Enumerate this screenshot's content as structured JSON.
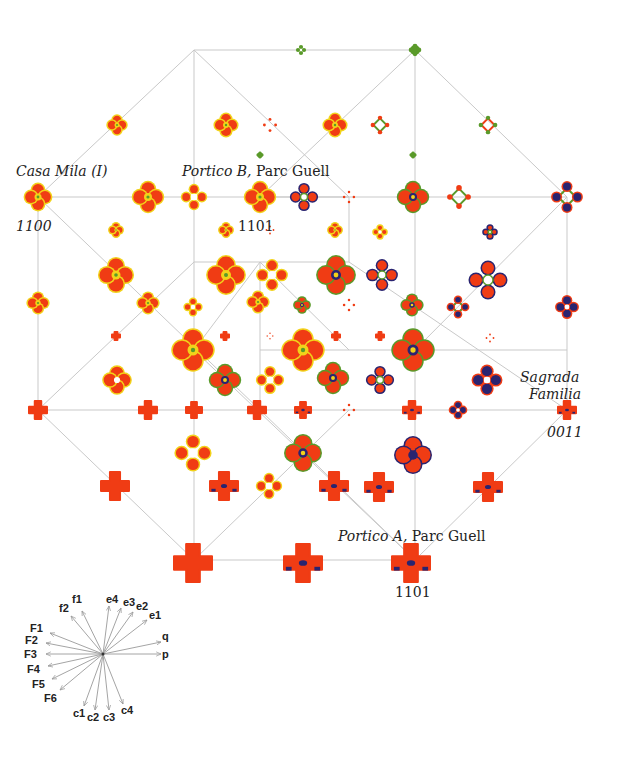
{
  "figure": {
    "type": "hypercube-projection-diagram",
    "colors": {
      "edge": "#c9c9c9",
      "red": "#f03c14",
      "yellow": "#f2d21a",
      "green": "#5a9a2a",
      "navy": "#2a2470",
      "arrow": "#9a9a9a"
    }
  },
  "labels": {
    "casa_mila": "Casa Mila (I)",
    "casa_mila_code": "1100",
    "portico_b_italic": "Portico B,",
    "portico_b_rest": " Parc Guell",
    "portico_b_code": "1101",
    "sagrada_1": "Sagrada",
    "sagrada_2": "Familia",
    "sagrada_code": "0011",
    "portico_a_italic": "Portico A,",
    "portico_a_rest": " Parc Guell",
    "portico_a_code": "1101"
  },
  "edges": [
    [
      194,
      50,
      415,
      50
    ],
    [
      194,
      50,
      38,
      197
    ],
    [
      194,
      50,
      194,
      197
    ],
    [
      194,
      50,
      349,
      197
    ],
    [
      415,
      50,
      415,
      197
    ],
    [
      415,
      50,
      567,
      197
    ],
    [
      415,
      50,
      260,
      197
    ],
    [
      38,
      197,
      349,
      197
    ],
    [
      260,
      197,
      567,
      197
    ],
    [
      38,
      197,
      38,
      410
    ],
    [
      38,
      197,
      260,
      410
    ],
    [
      194,
      197,
      194,
      350
    ],
    [
      349,
      197,
      349,
      262
    ],
    [
      349,
      262,
      194,
      262
    ],
    [
      349,
      262,
      567,
      410
    ],
    [
      415,
      197,
      415,
      410
    ],
    [
      567,
      197,
      567,
      410
    ],
    [
      567,
      197,
      415,
      350
    ],
    [
      194,
      262,
      38,
      410
    ],
    [
      260,
      262,
      260,
      410
    ],
    [
      260,
      350,
      567,
      350
    ],
    [
      38,
      410,
      567,
      410
    ],
    [
      38,
      410,
      194,
      560
    ],
    [
      194,
      350,
      194,
      560
    ],
    [
      194,
      350,
      415,
      560
    ],
    [
      260,
      410,
      415,
      560
    ],
    [
      349,
      410,
      194,
      560
    ],
    [
      415,
      410,
      415,
      560
    ],
    [
      567,
      410,
      415,
      560
    ],
    [
      194,
      560,
      415,
      560
    ],
    [
      260,
      262,
      349,
      350
    ],
    [
      260,
      262,
      194,
      350
    ]
  ],
  "nodes": [
    {
      "x": 301,
      "y": 50,
      "s": 6,
      "kind": "green-ring"
    },
    {
      "x": 415,
      "y": 50,
      "s": 7,
      "kind": "green-solid"
    },
    {
      "x": 117,
      "y": 125,
      "s": 10,
      "kind": "yellow-cluster"
    },
    {
      "x": 226,
      "y": 125,
      "s": 12,
      "kind": "yellow-cluster"
    },
    {
      "x": 270,
      "y": 125,
      "s": 8,
      "kind": "red-dots"
    },
    {
      "x": 335,
      "y": 125,
      "s": 12,
      "kind": "yellow-cluster"
    },
    {
      "x": 380,
      "y": 125,
      "s": 11,
      "kind": "red-lattice"
    },
    {
      "x": 488,
      "y": 125,
      "s": 11,
      "kind": "green-lattice"
    },
    {
      "x": 260,
      "y": 155,
      "s": 4,
      "kind": "green-solid"
    },
    {
      "x": 413,
      "y": 155,
      "s": 4,
      "kind": "green-solid"
    },
    {
      "x": 38,
      "y": 197,
      "s": 14,
      "kind": "yellow-cluster"
    },
    {
      "x": 148,
      "y": 197,
      "s": 16,
      "kind": "yellow-cluster"
    },
    {
      "x": 194,
      "y": 197,
      "s": 13,
      "kind": "red-ring"
    },
    {
      "x": 260,
      "y": 197,
      "s": 16,
      "kind": "yellow-cluster"
    },
    {
      "x": 304,
      "y": 197,
      "s": 14,
      "kind": "mixed-ring"
    },
    {
      "x": 349,
      "y": 197,
      "s": 7,
      "kind": "red-dots"
    },
    {
      "x": 413,
      "y": 197,
      "s": 16,
      "kind": "mixed-cluster"
    },
    {
      "x": 459,
      "y": 197,
      "s": 14,
      "kind": "red-lattice"
    },
    {
      "x": 567,
      "y": 197,
      "s": 16,
      "kind": "navy-lattice"
    },
    {
      "x": 116,
      "y": 230,
      "s": 7,
      "kind": "yellow-cluster"
    },
    {
      "x": 226,
      "y": 230,
      "s": 7,
      "kind": "yellow-cluster"
    },
    {
      "x": 270,
      "y": 230,
      "s": 5,
      "kind": "red-dots"
    },
    {
      "x": 335,
      "y": 230,
      "s": 7,
      "kind": "yellow-cluster"
    },
    {
      "x": 380,
      "y": 232,
      "s": 7,
      "kind": "red-ring"
    },
    {
      "x": 490,
      "y": 232,
      "s": 7,
      "kind": "mixed-ring"
    },
    {
      "x": 116,
      "y": 275,
      "s": 18,
      "kind": "yellow-cluster"
    },
    {
      "x": 226,
      "y": 275,
      "s": 20,
      "kind": "yellow-cluster"
    },
    {
      "x": 272,
      "y": 275,
      "s": 16,
      "kind": "red-ring"
    },
    {
      "x": 336,
      "y": 275,
      "s": 20,
      "kind": "mixed-cluster"
    },
    {
      "x": 382,
      "y": 275,
      "s": 16,
      "kind": "mixed-ring"
    },
    {
      "x": 488,
      "y": 280,
      "s": 20,
      "kind": "mixed-ring"
    },
    {
      "x": 38,
      "y": 303,
      "s": 11,
      "kind": "yellow-cluster"
    },
    {
      "x": 148,
      "y": 303,
      "s": 11,
      "kind": "yellow-cluster"
    },
    {
      "x": 193,
      "y": 307,
      "s": 9,
      "kind": "red-ring"
    },
    {
      "x": 258,
      "y": 302,
      "s": 11,
      "kind": "yellow-cluster"
    },
    {
      "x": 302,
      "y": 305,
      "s": 8,
      "kind": "mixed-cluster"
    },
    {
      "x": 349,
      "y": 305,
      "s": 7,
      "kind": "red-dots"
    },
    {
      "x": 412,
      "y": 305,
      "s": 11,
      "kind": "mixed-cluster"
    },
    {
      "x": 458,
      "y": 307,
      "s": 11,
      "kind": "navy-lattice"
    },
    {
      "x": 567,
      "y": 307,
      "s": 12,
      "kind": "navy-ring"
    },
    {
      "x": 116,
      "y": 336,
      "s": 4,
      "kind": "red-solid"
    },
    {
      "x": 225,
      "y": 336,
      "s": 4,
      "kind": "red-solid"
    },
    {
      "x": 270,
      "y": 336,
      "s": 4,
      "kind": "red-dots"
    },
    {
      "x": 336,
      "y": 336,
      "s": 4,
      "kind": "red-solid"
    },
    {
      "x": 380,
      "y": 336,
      "s": 4,
      "kind": "red-solid"
    },
    {
      "x": 490,
      "y": 338,
      "s": 5,
      "kind": "red-dots"
    },
    {
      "x": 193,
      "y": 350,
      "s": 22,
      "kind": "yellow-cluster"
    },
    {
      "x": 303,
      "y": 350,
      "s": 22,
      "kind": "yellow-cluster"
    },
    {
      "x": 413,
      "y": 350,
      "s": 22,
      "kind": "mixed-cluster"
    },
    {
      "x": 117,
      "y": 380,
      "s": 14,
      "kind": "red-cluster"
    },
    {
      "x": 225,
      "y": 380,
      "s": 16,
      "kind": "mixed-cluster"
    },
    {
      "x": 270,
      "y": 380,
      "s": 14,
      "kind": "red-ring"
    },
    {
      "x": 333,
      "y": 378,
      "s": 16,
      "kind": "mixed-cluster"
    },
    {
      "x": 380,
      "y": 380,
      "s": 14,
      "kind": "mixed-ring"
    },
    {
      "x": 487,
      "y": 380,
      "s": 16,
      "kind": "navy-ring"
    },
    {
      "x": 38,
      "y": 410,
      "s": 9,
      "kind": "red-solid"
    },
    {
      "x": 148,
      "y": 410,
      "s": 9,
      "kind": "red-solid"
    },
    {
      "x": 194,
      "y": 410,
      "s": 8,
      "kind": "red-solid"
    },
    {
      "x": 257,
      "y": 410,
      "s": 9,
      "kind": "red-solid"
    },
    {
      "x": 303,
      "y": 410,
      "s": 8,
      "kind": "navy-solid"
    },
    {
      "x": 349,
      "y": 410,
      "s": 7,
      "kind": "red-dots"
    },
    {
      "x": 412,
      "y": 410,
      "s": 9,
      "kind": "navy-solid"
    },
    {
      "x": 458,
      "y": 410,
      "s": 9,
      "kind": "navy-ring"
    },
    {
      "x": 567,
      "y": 410,
      "s": 9,
      "kind": "navy-solid"
    },
    {
      "x": 193,
      "y": 453,
      "s": 19,
      "kind": "red-ring"
    },
    {
      "x": 303,
      "y": 453,
      "s": 19,
      "kind": "mixed-cluster"
    },
    {
      "x": 413,
      "y": 455,
      "s": 19,
      "kind": "navy-cluster"
    },
    {
      "x": 115,
      "y": 486,
      "s": 14,
      "kind": "red-solid"
    },
    {
      "x": 224,
      "y": 486,
      "s": 14,
      "kind": "navy-solid"
    },
    {
      "x": 269,
      "y": 486,
      "s": 13,
      "kind": "red-ring"
    },
    {
      "x": 334,
      "y": 486,
      "s": 14,
      "kind": "navy-solid"
    },
    {
      "x": 379,
      "y": 487,
      "s": 14,
      "kind": "navy-solid"
    },
    {
      "x": 488,
      "y": 487,
      "s": 14,
      "kind": "navy-solid"
    },
    {
      "x": 193,
      "y": 563,
      "s": 19,
      "kind": "red-solid"
    },
    {
      "x": 303,
      "y": 563,
      "s": 19,
      "kind": "navy-solid"
    },
    {
      "x": 411,
      "y": 563,
      "s": 19,
      "kind": "navy-solid"
    }
  ],
  "vector_legend": {
    "origin": [
      103,
      654
    ],
    "vectors": [
      {
        "name": "f1",
        "dx": -21,
        "dy": -43,
        "lx": -31,
        "ly": -61
      },
      {
        "name": "f2",
        "dx": -32,
        "dy": -38,
        "lx": -44,
        "ly": -52
      },
      {
        "name": "e4",
        "dx": 6,
        "dy": -48,
        "lx": 3,
        "ly": -61
      },
      {
        "name": "e3",
        "dx": 18,
        "dy": -46,
        "lx": 20,
        "ly": -58
      },
      {
        "name": "e2",
        "dx": 30,
        "dy": -42,
        "lx": 33,
        "ly": -54
      },
      {
        "name": "e1",
        "dx": 44,
        "dy": -34,
        "lx": 46,
        "ly": -45
      },
      {
        "name": "F1",
        "dx": -53,
        "dy": -21,
        "lx": -73,
        "ly": -32
      },
      {
        "name": "F2",
        "dx": -57,
        "dy": -11,
        "lx": -78,
        "ly": -20
      },
      {
        "name": "F3",
        "dx": -57,
        "dy": 0,
        "lx": -79,
        "ly": -6
      },
      {
        "name": "F4",
        "dx": -55,
        "dy": 12,
        "lx": -76,
        "ly": 9
      },
      {
        "name": "F5",
        "dx": -51,
        "dy": 25,
        "lx": -71,
        "ly": 24
      },
      {
        "name": "F6",
        "dx": -43,
        "dy": 36,
        "lx": -59,
        "ly": 38
      },
      {
        "name": "q",
        "dx": 58,
        "dy": -12,
        "lx": 59,
        "ly": -24
      },
      {
        "name": "p",
        "dx": 58,
        "dy": 0,
        "lx": 59,
        "ly": -6
      },
      {
        "name": "c1",
        "dx": -19,
        "dy": 52,
        "lx": -30,
        "ly": 53
      },
      {
        "name": "c2",
        "dx": -8,
        "dy": 56,
        "lx": -16,
        "ly": 57
      },
      {
        "name": "c3",
        "dx": 6,
        "dy": 56,
        "lx": 0,
        "ly": 57
      },
      {
        "name": "c4",
        "dx": 20,
        "dy": 50,
        "lx": 18,
        "ly": 50
      }
    ]
  }
}
